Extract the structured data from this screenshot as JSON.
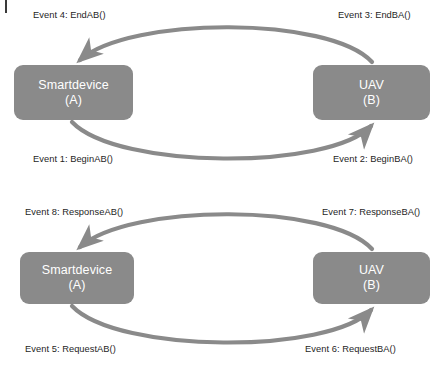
{
  "diagram": {
    "title_tick": "page-edge-mark",
    "line_color": "#8a8a8a",
    "node_fill": "#8a8a8a",
    "node_text_color": "#ffffff",
    "label_text_color": "#1e1e1e",
    "groups": [
      {
        "id": "session-group",
        "nodes": [
          {
            "id": "node-a-top",
            "name": "Smartdevice",
            "tag": "(A)"
          },
          {
            "id": "node-b-top",
            "name": "UAV",
            "tag": "(B)"
          }
        ],
        "edges": [
          {
            "id": "edge-top",
            "label": "Event 4: EndAB()",
            "direction": "B-to-A"
          },
          {
            "id": "edge-top-right",
            "label": "Event 3: EndBA()",
            "direction": "B-to-A"
          },
          {
            "id": "edge-bottom",
            "label": "Event 1: BeginAB()",
            "direction": "A-to-B"
          },
          {
            "id": "edge-bottom-right",
            "label": "Event 2: BeginBA()",
            "direction": "A-to-B"
          }
        ]
      },
      {
        "id": "request-response-group",
        "nodes": [
          {
            "id": "node-a-bottom",
            "name": "Smartdevice",
            "tag": "(A)"
          },
          {
            "id": "node-b-bottom",
            "name": "UAV",
            "tag": "(B)"
          }
        ],
        "edges": [
          {
            "id": "edge2-top",
            "label": "Event 8: ResponseAB()",
            "direction": "B-to-A"
          },
          {
            "id": "edge2-top-right",
            "label": "Event 7: ResponseBA()",
            "direction": "B-to-A"
          },
          {
            "id": "edge2-bottom",
            "label": "Event 5: RequestAB()",
            "direction": "A-to-B"
          },
          {
            "id": "edge2-bottom-right",
            "label": "Event 6: RequestBA()",
            "direction": "A-to-B"
          }
        ]
      }
    ]
  }
}
